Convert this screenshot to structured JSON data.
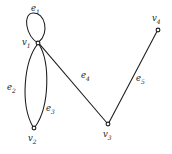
{
  "figure": {
    "kind": "multigraph-diagram",
    "background_color": "#ffffff",
    "stroke_color": "#1a1a1a",
    "width": 172,
    "height": 154
  },
  "vertices": [
    {
      "id": "v1",
      "label_main": "v",
      "label_sub": "1",
      "x": 38,
      "y": 43,
      "label_x": 22,
      "label_y": 38
    },
    {
      "id": "v2",
      "label_main": "v",
      "label_sub": "2",
      "x": 34,
      "y": 128,
      "label_x": 28,
      "label_y": 134
    },
    {
      "id": "v3",
      "label_main": "v",
      "label_sub": "3",
      "x": 108,
      "y": 124,
      "label_x": 103,
      "label_y": 130
    },
    {
      "id": "v4",
      "label_main": "v",
      "label_sub": "4",
      "x": 158,
      "y": 30,
      "label_x": 152,
      "label_y": 14
    }
  ],
  "edges": [
    {
      "id": "e1",
      "label_main": "e",
      "label_sub": "1",
      "from": "v1",
      "to": "v1",
      "type": "self-loop",
      "label_x": 31,
      "label_y": 4
    },
    {
      "id": "e2",
      "label_main": "e",
      "label_sub": "2",
      "from": "v1",
      "to": "v2",
      "type": "curve-left",
      "label_x": 7,
      "label_y": 83
    },
    {
      "id": "e3",
      "label_main": "e",
      "label_sub": "3",
      "from": "v1",
      "to": "v2",
      "type": "curve-right",
      "label_x": 46,
      "label_y": 104
    },
    {
      "id": "e4",
      "label_main": "e",
      "label_sub": "4",
      "from": "v1",
      "to": "v3",
      "type": "straight",
      "label_x": 81,
      "label_y": 71
    },
    {
      "id": "e5",
      "label_main": "e",
      "label_sub": "5",
      "from": "v3",
      "to": "v4",
      "type": "straight",
      "label_x": 136,
      "label_y": 74
    }
  ]
}
